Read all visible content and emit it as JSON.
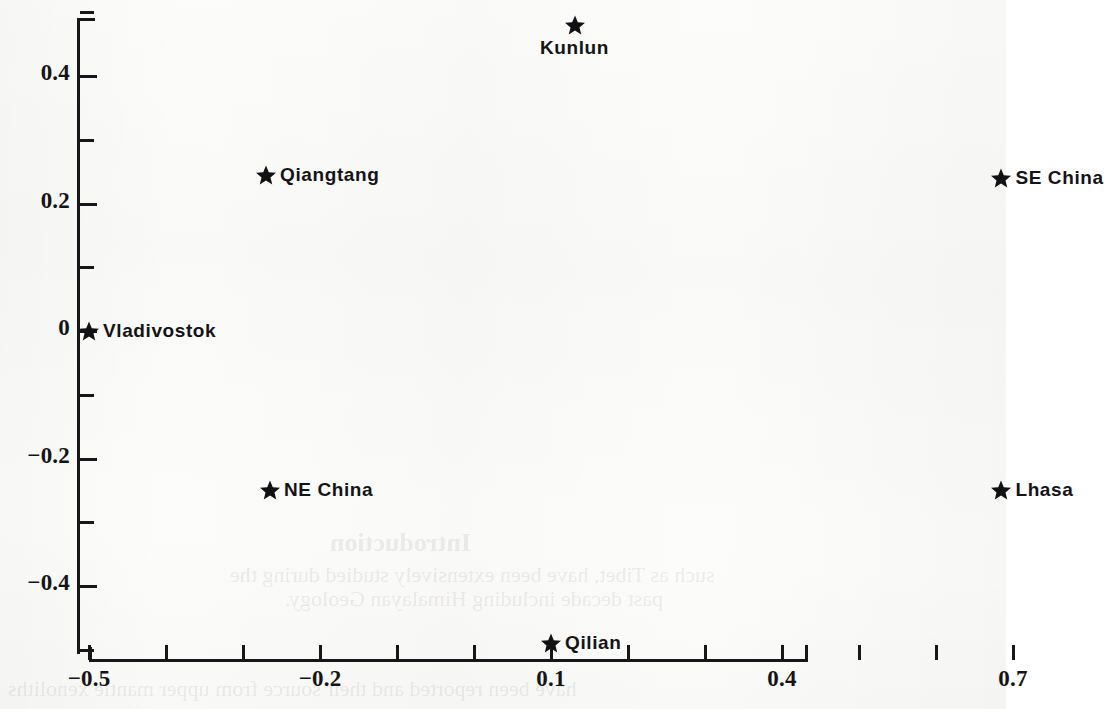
{
  "chart_data": {
    "type": "scatter",
    "title": "",
    "xlabel": "",
    "ylabel": "",
    "xlim": [
      -0.5,
      0.82
    ],
    "ylim": [
      -0.52,
      0.54
    ],
    "grid": false,
    "legend": "none",
    "marker": "star",
    "marker_color": "#111114",
    "x_ticks": [
      {
        "value": -0.5,
        "label": "−0.5"
      },
      {
        "value": -0.4,
        "label": ""
      },
      {
        "value": -0.3,
        "label": ""
      },
      {
        "value": -0.2,
        "label": "−0.2"
      },
      {
        "value": -0.1,
        "label": ""
      },
      {
        "value": 0.0,
        "label": ""
      },
      {
        "value": 0.1,
        "label": "0.1"
      },
      {
        "value": 0.2,
        "label": ""
      },
      {
        "value": 0.3,
        "label": ""
      },
      {
        "value": 0.4,
        "label": "0.4"
      },
      {
        "value": 0.5,
        "label": ""
      },
      {
        "value": 0.6,
        "label": ""
      },
      {
        "value": 0.7,
        "label": "0.7"
      }
    ],
    "y_ticks": [
      {
        "value": 0.5,
        "label": ""
      },
      {
        "value": 0.4,
        "label": "0.4"
      },
      {
        "value": 0.3,
        "label": ""
      },
      {
        "value": 0.2,
        "label": "0.2"
      },
      {
        "value": 0.1,
        "label": ""
      },
      {
        "value": 0.0,
        "label": "0"
      },
      {
        "value": -0.1,
        "label": ""
      },
      {
        "value": -0.2,
        "label": "−0.2"
      },
      {
        "value": -0.3,
        "label": ""
      },
      {
        "value": -0.4,
        "label": "−0.4"
      },
      {
        "value": -0.5,
        "label": ""
      }
    ],
    "points": [
      {
        "label": "Kunlun",
        "x": 0.1,
        "y": 0.48,
        "label_position": "below"
      },
      {
        "label": "Qiangtang",
        "x": -0.27,
        "y": 0.245,
        "label_position": "right"
      },
      {
        "label": "SE China",
        "x": 0.685,
        "y": 0.24,
        "label_position": "right"
      },
      {
        "label": "Vladivostok",
        "x": -0.5,
        "y": 0.0,
        "label_position": "right"
      },
      {
        "label": "NE China",
        "x": -0.265,
        "y": -0.25,
        "label_position": "right"
      },
      {
        "label": "Lhasa",
        "x": 0.685,
        "y": -0.25,
        "label_position": "right"
      },
      {
        "label": "Qilian",
        "x": 0.1,
        "y": -0.49,
        "label_position": "right"
      }
    ]
  },
  "page_bleed": {
    "heading": "Introduction",
    "lines": [
      "such as Tibet, have been extensively studied during the",
      "past decade including Himalayan Geology."
    ],
    "footer": "have been reported and their source from upper mantle xenoliths"
  }
}
